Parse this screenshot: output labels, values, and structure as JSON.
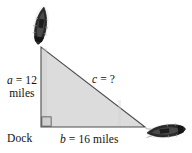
{
  "figure": {
    "triangle": {
      "fill_color": "#dcdcdc",
      "stroke_color": "#4d4d4d",
      "apex": {
        "x": 41,
        "y": 47
      },
      "bottom_left": {
        "x": 41,
        "y": 127
      },
      "bottom_right": {
        "x": 145,
        "y": 127
      }
    },
    "right_angle_marker": "right-angle-square"
  },
  "labels": {
    "side_a": {
      "variable": "a",
      "equals": " = ",
      "value": "12",
      "unit": "miles"
    },
    "side_b": {
      "variable": "b",
      "equals": " = ",
      "value": "16 miles"
    },
    "side_c": {
      "variable": "c",
      "equals": " = ",
      "value": "?"
    },
    "dock": "Dock"
  },
  "objects": {
    "boat_top": "boat-icon",
    "boat_right": "boat-icon"
  },
  "colors": {
    "triangle_fill": "#dcdcdc",
    "triangle_stroke": "#4d4d4d",
    "boat_dark": "#2b2b2b",
    "text": "#111111",
    "background": "#ffffff"
  }
}
